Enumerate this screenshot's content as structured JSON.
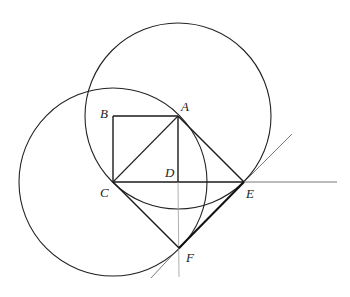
{
  "figure": {
    "points": {
      "A": {
        "label": "A",
        "x": 178,
        "y": 116
      },
      "B": {
        "label": "B",
        "x": 113,
        "y": 116
      },
      "C": {
        "label": "C",
        "x": 113,
        "y": 182
      },
      "D": {
        "label": "D",
        "x": 178,
        "y": 182
      },
      "E": {
        "label": "E",
        "x": 244,
        "y": 182
      },
      "F": {
        "label": "F",
        "x": 179,
        "y": 248
      }
    },
    "labels": {
      "A": "A",
      "B": "B",
      "C": "C",
      "D": "D",
      "E": "E",
      "F": "F"
    },
    "circles": [
      {
        "name": "circle-A",
        "center": "A",
        "cx": 178,
        "cy": 116,
        "r": 93
      },
      {
        "name": "circle-C",
        "center": "C",
        "cx": 113,
        "cy": 182,
        "r": 94
      }
    ],
    "colors": {
      "stroke": "#1a1a1a",
      "faint": "#9a9a9a",
      "background": "#ffffff"
    }
  }
}
